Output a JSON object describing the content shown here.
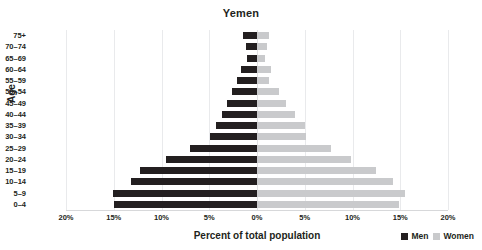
{
  "chart_data": {
    "type": "bar",
    "subtype": "population-pyramid",
    "title": "Yemen",
    "xlabel": "Percent of total population",
    "ylabel": "Age",
    "xlim": [
      -20,
      20
    ],
    "xticks": [
      "20%",
      "15%",
      "10%",
      "5%",
      "0%",
      "5%",
      "10%",
      "15%",
      "20%"
    ],
    "xtick_values": [
      -20,
      -15,
      -10,
      -5,
      0,
      5,
      10,
      15,
      20
    ],
    "grid": true,
    "legend_position": "bottom-right",
    "categories": [
      "75+",
      "70–74",
      "65–69",
      "60–64",
      "55–59",
      "50–54",
      "45–49",
      "40–44",
      "35–39",
      "30–34",
      "25–29",
      "20–24",
      "15–19",
      "10–14",
      "5–9",
      "0–4"
    ],
    "series": [
      {
        "name": "Men",
        "color": "#231f20",
        "direction": "left",
        "values": [
          1.5,
          1.2,
          1.0,
          1.7,
          2.1,
          2.6,
          3.1,
          3.7,
          4.3,
          4.9,
          7.0,
          9.5,
          12.3,
          13.2,
          15.1,
          15.0
        ]
      },
      {
        "name": "Women",
        "color": "#c9cacc",
        "direction": "right",
        "values": [
          1.3,
          1.0,
          0.8,
          1.5,
          1.3,
          2.3,
          3.0,
          4.0,
          5.0,
          5.1,
          7.7,
          9.8,
          12.5,
          14.2,
          15.5,
          14.9
        ]
      }
    ]
  },
  "legend": {
    "items": [
      {
        "label": "Men",
        "color": "#231f20"
      },
      {
        "label": "Women",
        "color": "#c9cacc"
      }
    ]
  }
}
